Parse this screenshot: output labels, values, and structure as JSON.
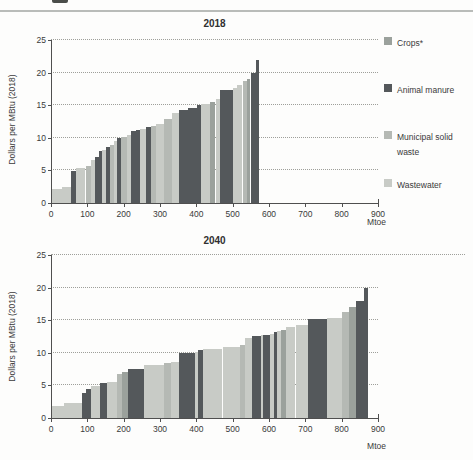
{
  "figure": {
    "colors": {
      "crops": "#9ba19c",
      "animal_manure": "#54585b",
      "municipal_solid_waste": "#b5b9b4",
      "wastewater": "#c8cbc6",
      "axis": "#4f4f4f",
      "grid": "#9e9f9a",
      "text": "#3a3a3a"
    },
    "legend": {
      "position": "right-of-first-chart",
      "items": [
        {
          "key": "crops",
          "label": "Crops*",
          "color": "#9ba19c"
        },
        {
          "key": "animal_manure",
          "label": "Animal manure",
          "color": "#54585b"
        },
        {
          "key": "municipal_solid_waste",
          "label": "Municipal solid waste",
          "color": "#b5b9b4"
        },
        {
          "key": "wastewater",
          "label": "Wastewater",
          "color": "#c8cbc6"
        }
      ]
    }
  },
  "chart_data": [
    {
      "type": "bar",
      "variant": "supply-cost-curve",
      "title": "2018",
      "ylabel": "Dollars per MBtu (2018)",
      "xlabel": "Mtoe",
      "xlim": [
        0,
        900
      ],
      "ylim": [
        0,
        25
      ],
      "y_ticks": [
        0,
        5,
        10,
        15,
        20,
        25
      ],
      "x_ticks": [
        0,
        100,
        200,
        300,
        400,
        500,
        600,
        700,
        800,
        900
      ],
      "grid": "dotted-horizontal",
      "total_potential_mtoe": 573,
      "max_cost": 22,
      "segments": [
        {
          "from": 0,
          "to": 30,
          "value": 2.2,
          "category": "wastewater"
        },
        {
          "from": 30,
          "to": 55,
          "value": 2.5,
          "category": "wastewater"
        },
        {
          "from": 55,
          "to": 70,
          "value": 4.9,
          "category": "animal_manure"
        },
        {
          "from": 70,
          "to": 95,
          "value": 5.4,
          "category": "wastewater"
        },
        {
          "from": 95,
          "to": 110,
          "value": 5.7,
          "category": "municipal_solid_waste"
        },
        {
          "from": 110,
          "to": 122,
          "value": 6.6,
          "category": "wastewater"
        },
        {
          "from": 122,
          "to": 132,
          "value": 7.1,
          "category": "animal_manure"
        },
        {
          "from": 132,
          "to": 141,
          "value": 8.0,
          "category": "animal_manure"
        },
        {
          "from": 141,
          "to": 151,
          "value": 8.2,
          "category": "wastewater"
        },
        {
          "from": 151,
          "to": 162,
          "value": 8.6,
          "category": "animal_manure"
        },
        {
          "from": 162,
          "to": 173,
          "value": 8.9,
          "category": "municipal_solid_waste"
        },
        {
          "from": 173,
          "to": 182,
          "value": 9.5,
          "category": "wastewater"
        },
        {
          "from": 182,
          "to": 193,
          "value": 10.0,
          "category": "animal_manure"
        },
        {
          "from": 193,
          "to": 208,
          "value": 10.2,
          "category": "municipal_solid_waste"
        },
        {
          "from": 208,
          "to": 220,
          "value": 10.4,
          "category": "wastewater"
        },
        {
          "from": 220,
          "to": 233,
          "value": 11.0,
          "category": "animal_manure"
        },
        {
          "from": 233,
          "to": 244,
          "value": 11.2,
          "category": "animal_manure"
        },
        {
          "from": 244,
          "to": 262,
          "value": 11.3,
          "category": "wastewater"
        },
        {
          "from": 262,
          "to": 274,
          "value": 11.6,
          "category": "animal_manure"
        },
        {
          "from": 274,
          "to": 288,
          "value": 11.8,
          "category": "municipal_solid_waste"
        },
        {
          "from": 288,
          "to": 312,
          "value": 12.2,
          "category": "wastewater"
        },
        {
          "from": 312,
          "to": 334,
          "value": 12.9,
          "category": "municipal_solid_waste"
        },
        {
          "from": 334,
          "to": 353,
          "value": 13.8,
          "category": "wastewater"
        },
        {
          "from": 353,
          "to": 378,
          "value": 14.3,
          "category": "animal_manure"
        },
        {
          "from": 378,
          "to": 402,
          "value": 14.6,
          "category": "animal_manure"
        },
        {
          "from": 402,
          "to": 412,
          "value": 15.0,
          "category": "animal_manure"
        },
        {
          "from": 412,
          "to": 438,
          "value": 15.2,
          "category": "wastewater"
        },
        {
          "from": 438,
          "to": 453,
          "value": 15.5,
          "category": "crops"
        },
        {
          "from": 453,
          "to": 466,
          "value": 15.9,
          "category": "wastewater"
        },
        {
          "from": 466,
          "to": 500,
          "value": 17.3,
          "category": "animal_manure"
        },
        {
          "from": 500,
          "to": 513,
          "value": 17.6,
          "category": "wastewater"
        },
        {
          "from": 513,
          "to": 527,
          "value": 18.1,
          "category": "wastewater"
        },
        {
          "from": 527,
          "to": 540,
          "value": 18.7,
          "category": "municipal_solid_waste"
        },
        {
          "from": 540,
          "to": 549,
          "value": 19.0,
          "category": "crops"
        },
        {
          "from": 549,
          "to": 565,
          "value": 20.0,
          "category": "animal_manure"
        },
        {
          "from": 565,
          "to": 573,
          "value": 22.0,
          "category": "animal_manure"
        }
      ]
    },
    {
      "type": "bar",
      "variant": "supply-cost-curve",
      "title": "2040",
      "ylabel": "Dollars per MBtu (2018)",
      "xlabel": "Mtoe",
      "xlim": [
        0,
        900
      ],
      "ylim": [
        0,
        25
      ],
      "y_ticks": [
        0,
        5,
        10,
        15,
        20,
        25
      ],
      "x_ticks": [
        0,
        100,
        200,
        300,
        400,
        500,
        600,
        700,
        800,
        900
      ],
      "grid": "dotted-horizontal",
      "total_potential_mtoe": 872,
      "max_cost": 20,
      "segments": [
        {
          "from": 0,
          "to": 37,
          "value": 1.8,
          "category": "wastewater"
        },
        {
          "from": 37,
          "to": 85,
          "value": 2.3,
          "category": "wastewater"
        },
        {
          "from": 85,
          "to": 97,
          "value": 3.8,
          "category": "animal_manure"
        },
        {
          "from": 97,
          "to": 110,
          "value": 4.5,
          "category": "animal_manure"
        },
        {
          "from": 110,
          "to": 136,
          "value": 4.9,
          "category": "wastewater"
        },
        {
          "from": 136,
          "to": 153,
          "value": 5.3,
          "category": "animal_manure"
        },
        {
          "from": 153,
          "to": 182,
          "value": 5.5,
          "category": "wastewater"
        },
        {
          "from": 182,
          "to": 196,
          "value": 6.7,
          "category": "municipal_solid_waste"
        },
        {
          "from": 196,
          "to": 213,
          "value": 7.0,
          "category": "crops"
        },
        {
          "from": 213,
          "to": 257,
          "value": 7.5,
          "category": "animal_manure"
        },
        {
          "from": 257,
          "to": 310,
          "value": 8.2,
          "category": "wastewater"
        },
        {
          "from": 310,
          "to": 331,
          "value": 8.4,
          "category": "municipal_solid_waste"
        },
        {
          "from": 331,
          "to": 352,
          "value": 8.6,
          "category": "wastewater"
        },
        {
          "from": 352,
          "to": 396,
          "value": 10.0,
          "category": "animal_manure"
        },
        {
          "from": 396,
          "to": 404,
          "value": 10.2,
          "category": "wastewater"
        },
        {
          "from": 404,
          "to": 418,
          "value": 10.5,
          "category": "animal_manure"
        },
        {
          "from": 418,
          "to": 472,
          "value": 10.6,
          "category": "wastewater"
        },
        {
          "from": 472,
          "to": 520,
          "value": 10.9,
          "category": "wastewater"
        },
        {
          "from": 520,
          "to": 533,
          "value": 11.2,
          "category": "municipal_solid_waste"
        },
        {
          "from": 533,
          "to": 552,
          "value": 12.3,
          "category": "wastewater"
        },
        {
          "from": 552,
          "to": 577,
          "value": 12.6,
          "category": "animal_manure"
        },
        {
          "from": 577,
          "to": 584,
          "value": 12.7,
          "category": "wastewater"
        },
        {
          "from": 584,
          "to": 602,
          "value": 12.8,
          "category": "animal_manure"
        },
        {
          "from": 602,
          "to": 613,
          "value": 12.9,
          "category": "wastewater"
        },
        {
          "from": 613,
          "to": 623,
          "value": 13.2,
          "category": "animal_manure"
        },
        {
          "from": 623,
          "to": 633,
          "value": 13.3,
          "category": "wastewater"
        },
        {
          "from": 633,
          "to": 646,
          "value": 13.5,
          "category": "crops"
        },
        {
          "from": 646,
          "to": 673,
          "value": 14.0,
          "category": "wastewater"
        },
        {
          "from": 673,
          "to": 706,
          "value": 14.2,
          "category": "wastewater"
        },
        {
          "from": 706,
          "to": 760,
          "value": 15.2,
          "category": "animal_manure"
        },
        {
          "from": 760,
          "to": 800,
          "value": 15.4,
          "category": "wastewater"
        },
        {
          "from": 800,
          "to": 820,
          "value": 16.3,
          "category": "municipal_solid_waste"
        },
        {
          "from": 820,
          "to": 840,
          "value": 17.1,
          "category": "crops"
        },
        {
          "from": 840,
          "to": 862,
          "value": 18.0,
          "category": "animal_manure"
        },
        {
          "from": 862,
          "to": 872,
          "value": 20.0,
          "category": "animal_manure"
        }
      ]
    }
  ]
}
